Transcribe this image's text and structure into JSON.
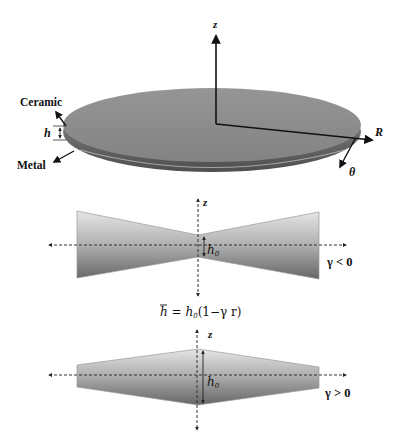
{
  "figure": {
    "disk": {
      "top_label": "Ceramic",
      "bottom_label": "Metal",
      "thickness_label": "h",
      "axis_z": "z",
      "axis_r": "R",
      "axis_theta": "θ",
      "colors": {
        "top": "#8c8c8c",
        "rim": "#5e5e5e",
        "rim_highlight": "#b9b9b9"
      }
    },
    "profile_negative": {
      "axis_z": "z",
      "h0_label": "h",
      "h0_sub": "0",
      "condition": "γ < 0"
    },
    "formula": {
      "lhs": "h",
      "eq": " = ",
      "rhs_h": "h",
      "rhs_sub": "0",
      "rhs_rest": "(1−γ r)"
    },
    "profile_positive": {
      "axis_z": "z",
      "h0_label": "h",
      "h0_sub": "0",
      "condition": "γ > 0"
    },
    "gradient_colors": {
      "light": "#e4e4e4",
      "dark": "#6a6a6a"
    }
  }
}
